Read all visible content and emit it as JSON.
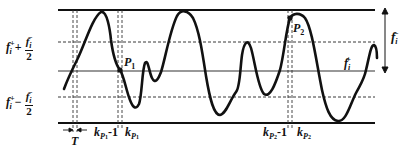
{
  "diagram": {
    "type": "signal-threshold-diagram",
    "levels": {
      "upper_label": "f_i^+ + f_i^- / 2",
      "lower_label": "f_i^+ - f_i^- / 2",
      "base_label": "f_i^+",
      "range_label": "f_i^-"
    },
    "points": [
      {
        "name": "P1",
        "label": "P",
        "sub": "1"
      },
      {
        "name": "P2",
        "label": "P",
        "sub": "2"
      }
    ],
    "axis_labels": {
      "period": "T",
      "k_p1_minus": {
        "k": "k",
        "sub": "P",
        "subsub": "1",
        "suffix": "-1"
      },
      "k_p1": {
        "k": "k",
        "sub": "P",
        "subsub": "1"
      },
      "k_p2_minus": {
        "k": "k",
        "sub": "P",
        "subsub": "2",
        "suffix": "-1"
      },
      "k_p2": {
        "k": "k",
        "sub": "P",
        "subsub": "2"
      }
    },
    "text": {
      "f": "f",
      "i": "i",
      "plus_sign": "+",
      "minus_sign": "−",
      "plus_sup": "+",
      "minus_sup": "−",
      "two": "2",
      "P": "P",
      "one": "1",
      "twos": "2",
      "k": "k",
      "minus_one": "-1",
      "T": "T"
    },
    "colors": {
      "line": "#111111",
      "background": "#ffffff"
    }
  }
}
